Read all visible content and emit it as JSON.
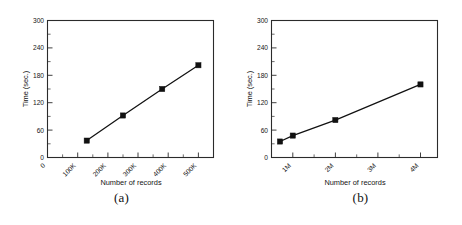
{
  "figure": {
    "panels": [
      {
        "caption": "(a)",
        "chart_data": {
          "type": "line",
          "title": "",
          "xlabel": "Number of records",
          "ylabel": "Time (sec.)",
          "x_ticklabels": [
            "0",
            "100K",
            "200K",
            "300K",
            "400K",
            "500K"
          ],
          "x_tickvalues": [
            0,
            100000,
            200000,
            300000,
            400000,
            500000
          ],
          "y_ticklabels": [
            "0",
            "60",
            "120",
            "180",
            "240",
            "300"
          ],
          "y_tickvalues": [
            0,
            60,
            120,
            180,
            240,
            300
          ],
          "xlim": [
            0,
            550000
          ],
          "ylim": [
            0,
            300
          ],
          "grid": false,
          "legend": "none",
          "minor_ticks": true,
          "marker": "square",
          "series": [
            {
              "name": "Time",
              "x": [
                130000,
                250000,
                380000,
                500000
              ],
              "values": [
                37,
                92,
                150,
                202
              ]
            }
          ]
        }
      },
      {
        "caption": "(b)",
        "chart_data": {
          "type": "line",
          "title": "",
          "xlabel": "Number of records",
          "ylabel": "Time (sec.)",
          "x_ticklabels": [
            "1M",
            "2M",
            "3M",
            "4M"
          ],
          "x_tickvalues": [
            1000000,
            2000000,
            3000000,
            4000000
          ],
          "y_ticklabels": [
            "0",
            "60",
            "120",
            "180",
            "240",
            "300"
          ],
          "y_tickvalues": [
            0,
            60,
            120,
            180,
            240,
            300
          ],
          "xlim": [
            500000,
            4400000
          ],
          "ylim": [
            0,
            300
          ],
          "grid": false,
          "legend": "none",
          "minor_ticks": true,
          "marker": "square",
          "series": [
            {
              "name": "Time",
              "x": [
                700000,
                1000000,
                2000000,
                4000000
              ],
              "values": [
                35,
                48,
                82,
                160
              ]
            }
          ]
        }
      }
    ]
  }
}
